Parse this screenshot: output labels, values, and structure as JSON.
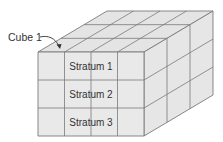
{
  "diagram": {
    "type": "isometric-cube-grid",
    "callout": {
      "label": "Cube 1"
    },
    "strata": [
      {
        "label": "Stratum 1"
      },
      {
        "label": "Stratum 2"
      },
      {
        "label": "Stratum 3"
      }
    ],
    "grid": {
      "columns": 4,
      "rows": 3,
      "depth": 3
    },
    "colors": {
      "face_front": "#e9e9e9",
      "face_top": "#e4e4e4",
      "face_side": "#e6e6e6",
      "line": "#7a7a7a",
      "text": "#333333"
    }
  }
}
